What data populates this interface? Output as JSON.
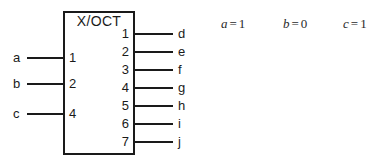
{
  "diagram": {
    "title": "X/OCT",
    "chip": {
      "label": "X/OCT",
      "left_pins": [
        {
          "number": "1",
          "signal": "a",
          "y": 57
        },
        {
          "number": "2",
          "signal": "b",
          "y": 83
        },
        {
          "number": "4",
          "signal": "c",
          "y": 113
        }
      ],
      "right_pins": [
        {
          "number": "1",
          "signal": "d",
          "y": 33
        },
        {
          "number": "2",
          "signal": "e",
          "y": 51
        },
        {
          "number": "3",
          "signal": "f",
          "y": 69
        },
        {
          "number": "4",
          "signal": "g",
          "y": 87
        },
        {
          "number": "5",
          "signal": "h",
          "y": 105
        },
        {
          "number": "6",
          "signal": "i",
          "y": 123
        },
        {
          "number": "7",
          "signal": "j",
          "y": 141
        }
      ]
    },
    "equations": [
      {
        "variable": "a",
        "operator": "=",
        "value": "1"
      },
      {
        "variable": "b",
        "operator": "=",
        "value": "0"
      },
      {
        "variable": "c",
        "operator": "=",
        "value": "1"
      }
    ],
    "colors": {
      "line": "#1a1a1a",
      "background": "#ffffff",
      "text": "#1a1a1a",
      "equation_text": "#2a2a2a"
    }
  }
}
